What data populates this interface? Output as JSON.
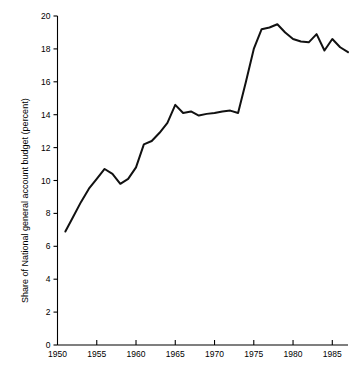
{
  "chart_data": {
    "type": "line",
    "title": "",
    "xlabel": "",
    "ylabel": "Share of National general account budget (percent)",
    "xlim": [
      1950,
      1987
    ],
    "ylim": [
      0,
      20
    ],
    "grid": false,
    "legend": "none",
    "xticks": [
      1950,
      1955,
      1960,
      1965,
      1970,
      1975,
      1980,
      1985
    ],
    "xtick_labels": [
      "1950",
      "1955",
      "1960",
      "1965",
      "1970",
      "1975",
      "1980",
      "1985"
    ],
    "yticks": [
      0,
      2,
      4,
      6,
      8,
      10,
      12,
      14,
      16,
      18,
      20
    ],
    "ytick_labels": [
      "0",
      "2",
      "4",
      "6",
      "8",
      "10",
      "12",
      "14",
      "16",
      "18",
      "20"
    ],
    "line_color": "#111111",
    "series": [
      {
        "name": "Share of National general account budget",
        "x": [
          1951,
          1952,
          1953,
          1954,
          1955,
          1956,
          1957,
          1958,
          1959,
          1960,
          1961,
          1962,
          1963,
          1964,
          1965,
          1966,
          1967,
          1968,
          1969,
          1970,
          1971,
          1972,
          1973,
          1974,
          1975,
          1976,
          1977,
          1978,
          1979,
          1980,
          1981,
          1982,
          1983,
          1984,
          1985,
          1986,
          1987
        ],
        "values": [
          6.9,
          7.8,
          8.7,
          9.5,
          10.1,
          10.7,
          10.4,
          9.8,
          10.1,
          10.8,
          12.2,
          12.4,
          12.9,
          13.5,
          14.6,
          14.1,
          14.2,
          13.95,
          14.05,
          14.1,
          14.2,
          14.25,
          14.1,
          16.0,
          18.0,
          19.2,
          19.3,
          19.5,
          19.0,
          18.6,
          18.45,
          18.4,
          18.9,
          17.9,
          18.6,
          18.1,
          17.8
        ]
      }
    ]
  },
  "axis_labels": {
    "y_axis_title": "Share of National general account budget (percent)"
  }
}
